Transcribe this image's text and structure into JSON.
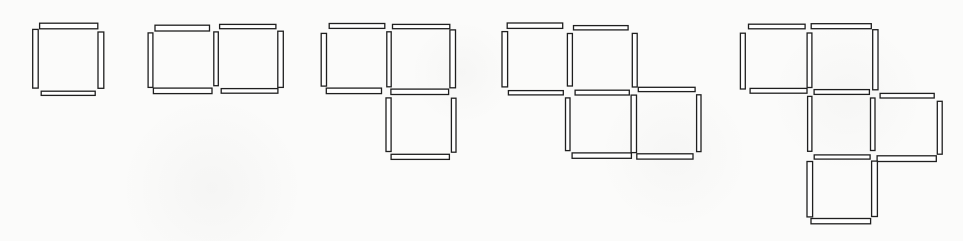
{
  "page": {
    "background_color": "#fbfbfa"
  },
  "pattern": {
    "ink_color": "#1f1f1f",
    "fill_color": "#ffffff",
    "stroke_width": 1.3,
    "unit": 65,
    "stick_thickness": 5,
    "figures": [
      {
        "name": "figure-1",
        "squares_count": 1,
        "sticks_count": 4,
        "x": 36,
        "y": 27,
        "squares": [
          [
            0,
            0
          ]
        ]
      },
      {
        "name": "figure-2",
        "squares_count": 2,
        "sticks_count": 7,
        "x": 150,
        "y": 27,
        "squares": [
          [
            0,
            0
          ],
          [
            1,
            0
          ]
        ]
      },
      {
        "name": "figure-3",
        "squares_count": 3,
        "sticks_count": 10,
        "x": 323,
        "y": 27,
        "squares": [
          [
            0,
            0
          ],
          [
            1,
            0
          ],
          [
            1,
            1
          ]
        ]
      },
      {
        "name": "figure-4",
        "squares_count": 4,
        "sticks_count": 13,
        "x": 504,
        "y": 27,
        "squares": [
          [
            0,
            0
          ],
          [
            1,
            0
          ],
          [
            1,
            1
          ],
          [
            2,
            1
          ]
        ],
        "edge_offsets": {
          "h:2,1": -2,
          "h:2,2": -2,
          "v:3,1": -2
        }
      },
      {
        "name": "figure-5",
        "squares_count": 5,
        "sticks_count": 16,
        "x": 744,
        "y": 27,
        "squares": [
          [
            0,
            0
          ],
          [
            1,
            0
          ],
          [
            1,
            1
          ],
          [
            2,
            1
          ],
          [
            1,
            2
          ]
        ],
        "edge_offsets": {
          "h:2,1": 3,
          "h:2,2": 3,
          "v:3,1": 3
        }
      }
    ]
  }
}
